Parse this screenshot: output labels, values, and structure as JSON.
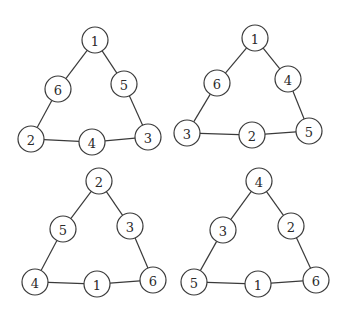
{
  "figure": {
    "width": 347,
    "height": 316,
    "node_radius": 13,
    "colors": {
      "stroke": "#3a3a3a",
      "text": "#2a2a2a",
      "background": "#ffffff"
    },
    "triangles": [
      {
        "id": "top-left",
        "nodes": {
          "top": {
            "label": "1",
            "x": 95,
            "y": 40
          },
          "left_mid": {
            "label": "6",
            "x": 58,
            "y": 89
          },
          "right_mid": {
            "label": "5",
            "x": 124,
            "y": 84
          },
          "bottom_left": {
            "label": "2",
            "x": 31,
            "y": 139
          },
          "bottom_mid": {
            "label": "4",
            "x": 92,
            "y": 142
          },
          "bottom_right": {
            "label": "3",
            "x": 148,
            "y": 137
          }
        }
      },
      {
        "id": "top-right",
        "nodes": {
          "top": {
            "label": "1",
            "x": 255,
            "y": 38
          },
          "left_mid": {
            "label": "6",
            "x": 217,
            "y": 83
          },
          "right_mid": {
            "label": "4",
            "x": 288,
            "y": 79
          },
          "bottom_left": {
            "label": "3",
            "x": 187,
            "y": 133
          },
          "bottom_mid": {
            "label": "2",
            "x": 252,
            "y": 135
          },
          "bottom_right": {
            "label": "5",
            "x": 309,
            "y": 131
          }
        }
      },
      {
        "id": "bottom-left",
        "nodes": {
          "top": {
            "label": "2",
            "x": 99,
            "y": 181
          },
          "left_mid": {
            "label": "5",
            "x": 63,
            "y": 229
          },
          "right_mid": {
            "label": "3",
            "x": 130,
            "y": 226
          },
          "bottom_left": {
            "label": "4",
            "x": 35,
            "y": 282
          },
          "bottom_mid": {
            "label": "1",
            "x": 97,
            "y": 284
          },
          "bottom_right": {
            "label": "6",
            "x": 153,
            "y": 280
          }
        }
      },
      {
        "id": "bottom-right",
        "nodes": {
          "top": {
            "label": "4",
            "x": 259,
            "y": 181
          },
          "left_mid": {
            "label": "3",
            "x": 223,
            "y": 230
          },
          "right_mid": {
            "label": "2",
            "x": 291,
            "y": 226
          },
          "bottom_left": {
            "label": "5",
            "x": 194,
            "y": 282
          },
          "bottom_mid": {
            "label": "1",
            "x": 258,
            "y": 284
          },
          "bottom_right": {
            "label": "6",
            "x": 316,
            "y": 280
          }
        }
      }
    ]
  }
}
